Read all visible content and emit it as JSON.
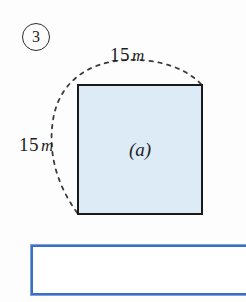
{
  "problem": {
    "number": "3",
    "number_style": "circled"
  },
  "figure": {
    "type": "square",
    "interior_label": "(a)",
    "fill_color": "#dcebf6",
    "stroke_color": "#1a1a1a",
    "dimensions": [
      {
        "position": "top",
        "value": "15",
        "unit": "m"
      },
      {
        "position": "left",
        "value": "15",
        "unit": "m"
      }
    ],
    "arc": {
      "style": "dashed",
      "color": "#3a3a3a",
      "description": "dashed-arc-around-square"
    }
  },
  "answer": {
    "value": "",
    "placeholder": "",
    "border_color": "#3a6fc4"
  }
}
